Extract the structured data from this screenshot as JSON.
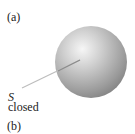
{
  "figure": {
    "panel_a_label": "(a)",
    "panel_b_label": "(b)",
    "surface_symbol": "S",
    "surface_caption": "closed",
    "colors": {
      "sphere_highlight": "#f4f4f4",
      "sphere_mid": "#b8b8b8",
      "sphere_edge": "#7a7a7a",
      "leader_line": "#bdbdbd"
    }
  }
}
